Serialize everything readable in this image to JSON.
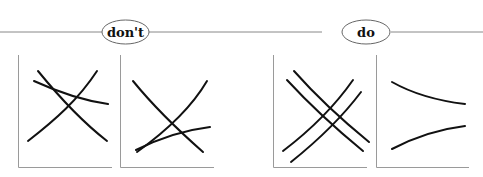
{
  "sections": [
    {
      "id": "dont",
      "label": "don't",
      "panels": [
        {
          "id": "dont-panel-1",
          "description": "three curves crossing at different points",
          "curves": [
            {
              "path": "M38,71 C60,98 80,120 107,141"
            },
            {
              "path": "M28,141 C55,120 78,100 97,71"
            },
            {
              "path": "M34,81 C58,92 80,100 108,104"
            }
          ]
        },
        {
          "id": "dont-panel-2",
          "description": "curves with nearly overlapping starts",
          "curves": [
            {
              "path": "M133,81 C155,108 178,130 203,152"
            },
            {
              "path": "M137,152 C165,132 190,110 207,81"
            },
            {
              "path": "M136,150 C160,138 185,130 210,127"
            }
          ]
        }
      ]
    },
    {
      "id": "do",
      "label": "do",
      "panels": [
        {
          "id": "do-panel-1",
          "description": "two pairs of parallel curves crossing symmetrically",
          "curves": [
            {
              "path": "M287,80 C310,105 335,128 363,151"
            },
            {
              "path": "M294,71 C317,97 342,120 369,142"
            },
            {
              "path": "M283,151 C308,132 332,110 353,80"
            },
            {
              "path": "M291,162 C316,142 340,120 361,92"
            }
          ]
        },
        {
          "id": "do-panel-2",
          "description": "two separated curves converging toward the right",
          "curves": [
            {
              "path": "M392,82 C415,95 440,101 465,104"
            },
            {
              "path": "M392,149 C415,137 440,129 465,126"
            }
          ]
        }
      ]
    }
  ],
  "colors": {
    "rule": "#888888",
    "axis": "#999999",
    "curve": "#111111",
    "label": "#111111"
  }
}
